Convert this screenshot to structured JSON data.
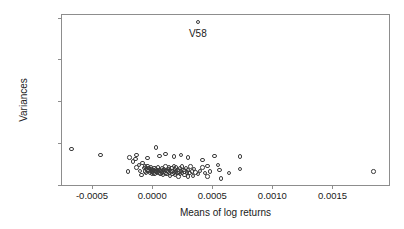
{
  "chart_data": {
    "type": "scatter",
    "title": "",
    "xlabel": "Means of log returns",
    "ylabel": "Variances",
    "xlim": [
      -0.00075,
      0.00197
    ],
    "ylim": [
      0.0,
      0.00203
    ],
    "xticks": [
      -0.0005,
      0.0,
      0.0005,
      0.001,
      0.0015
    ],
    "xtick_labels": [
      "-0.0005",
      "0.0000",
      "0.0005",
      "0.0010",
      "0.0015"
    ],
    "yticks": [
      0.0,
      0.0005,
      0.001,
      0.0015,
      0.002
    ],
    "ytick_labels": [
      "0.0000",
      "0.0005",
      "0.0010",
      "0.0015",
      "0.0020"
    ],
    "grid": false,
    "legend": null,
    "marker": "open-circle",
    "marker_color": "#3c3c3c",
    "annotations": [
      {
        "text": "V58",
        "x": 0.00038,
        "y": 0.00195,
        "describes_point": {
          "x": 0.00038,
          "y": 0.00195
        }
      }
    ],
    "points": [
      {
        "x": -0.00067,
        "y": 0.00043
      },
      {
        "x": -0.00043,
        "y": 0.00036
      },
      {
        "x": 0.00038,
        "y": 0.00195
      },
      {
        "x": -0.0002,
        "y": 0.00016
      },
      {
        "x": -0.00016,
        "y": 0.00028
      },
      {
        "x": -0.00014,
        "y": 0.00031
      },
      {
        "x": -0.00013,
        "y": 0.00021
      },
      {
        "x": -0.00011,
        "y": 0.00024
      },
      {
        "x": -0.0001,
        "y": 0.00017
      },
      {
        "x": -9e-05,
        "y": 0.00012
      },
      {
        "x": -8e-05,
        "y": 0.00026
      },
      {
        "x": -7e-05,
        "y": 0.0002
      },
      {
        "x": -6e-05,
        "y": 0.00016
      },
      {
        "x": -6e-05,
        "y": 0.00022
      },
      {
        "x": -5e-05,
        "y": 0.00019
      },
      {
        "x": -5e-05,
        "y": 0.00014
      },
      {
        "x": -4e-05,
        "y": 0.00018
      },
      {
        "x": -4e-05,
        "y": 0.00023
      },
      {
        "x": -3e-05,
        "y": 0.00017
      },
      {
        "x": -3e-05,
        "y": 0.0002
      },
      {
        "x": -2e-05,
        "y": 0.00015
      },
      {
        "x": -2e-05,
        "y": 0.00019
      },
      {
        "x": -1e-05,
        "y": 0.00017
      },
      {
        "x": -1e-05,
        "y": 0.00021
      },
      {
        "x": 0.0,
        "y": 0.00016
      },
      {
        "x": 0.0,
        "y": 0.00019
      },
      {
        "x": 0.0,
        "y": 0.00013
      },
      {
        "x": 1e-05,
        "y": 0.00018
      },
      {
        "x": 1e-05,
        "y": 0.00015
      },
      {
        "x": 2e-05,
        "y": 0.0002
      },
      {
        "x": 2e-05,
        "y": 0.00017
      },
      {
        "x": 2e-05,
        "y": 0.00013
      },
      {
        "x": 3e-05,
        "y": 0.00016
      },
      {
        "x": 3e-05,
        "y": 0.00019
      },
      {
        "x": 4e-05,
        "y": 0.00014
      },
      {
        "x": 4e-05,
        "y": 0.00018
      },
      {
        "x": 5e-05,
        "y": 0.00016
      },
      {
        "x": 5e-05,
        "y": 0.00021
      },
      {
        "x": 6e-05,
        "y": 0.00015
      },
      {
        "x": 6e-05,
        "y": 0.00018
      },
      {
        "x": 7e-05,
        "y": 0.00013
      },
      {
        "x": 7e-05,
        "y": 0.00017
      },
      {
        "x": 8e-05,
        "y": 0.0002
      },
      {
        "x": 8e-05,
        "y": 0.00015
      },
      {
        "x": 9e-05,
        "y": 0.00018
      },
      {
        "x": 9e-05,
        "y": 0.00012
      },
      {
        "x": 0.0001,
        "y": 0.00016
      },
      {
        "x": 0.0001,
        "y": 0.00019
      },
      {
        "x": 0.00011,
        "y": 0.00014
      },
      {
        "x": 0.00011,
        "y": 0.00022
      },
      {
        "x": 0.00012,
        "y": 0.00017
      },
      {
        "x": 0.00012,
        "y": 0.00013
      },
      {
        "x": 0.00013,
        "y": 0.00019
      },
      {
        "x": 0.00013,
        "y": 0.00016
      },
      {
        "x": 0.00014,
        "y": 0.00021
      },
      {
        "x": 0.00014,
        "y": 0.00014
      },
      {
        "x": 0.00015,
        "y": 0.00018
      },
      {
        "x": 0.00015,
        "y": 0.00011
      },
      {
        "x": 0.00016,
        "y": 0.00016
      },
      {
        "x": 0.00016,
        "y": 0.0002
      },
      {
        "x": 0.00017,
        "y": 0.00013
      },
      {
        "x": 0.00017,
        "y": 0.00017
      },
      {
        "x": 0.00018,
        "y": 0.00023
      },
      {
        "x": 0.00018,
        "y": 0.00015
      },
      {
        "x": 0.00019,
        "y": 0.00019
      },
      {
        "x": 0.00019,
        "y": 0.00012
      },
      {
        "x": 0.0002,
        "y": 0.00016
      },
      {
        "x": 0.0002,
        "y": 0.00021
      },
      {
        "x": 0.00021,
        "y": 0.00014
      },
      {
        "x": 0.00021,
        "y": 0.00018
      },
      {
        "x": 0.00022,
        "y": 0.0001
      },
      {
        "x": 0.00022,
        "y": 0.00016
      },
      {
        "x": 0.00023,
        "y": 0.0002
      },
      {
        "x": 0.00023,
        "y": 0.00013
      },
      {
        "x": 0.00024,
        "y": 0.00017
      },
      {
        "x": 0.00025,
        "y": 0.00014
      },
      {
        "x": 0.00025,
        "y": 0.00022
      },
      {
        "x": 0.00026,
        "y": 0.00018
      },
      {
        "x": 0.00027,
        "y": 0.00012
      },
      {
        "x": 0.00027,
        "y": 0.00016
      },
      {
        "x": 0.00028,
        "y": 0.0002
      },
      {
        "x": 0.00029,
        "y": 0.00015
      },
      {
        "x": 0.0003,
        "y": 0.0001
      },
      {
        "x": 0.0003,
        "y": 0.00018
      },
      {
        "x": 0.00031,
        "y": 0.00014
      },
      {
        "x": 0.00032,
        "y": 0.00022
      },
      {
        "x": 0.00033,
        "y": 0.00016
      },
      {
        "x": 0.00034,
        "y": 0.00011
      },
      {
        "x": 0.00035,
        "y": 0.00019
      },
      {
        "x": 0.00036,
        "y": 0.00015
      },
      {
        "x": 0.00038,
        "y": 0.00013
      },
      {
        "x": 0.0004,
        "y": 0.00017
      },
      {
        "x": 0.00042,
        "y": 0.00021
      },
      {
        "x": 0.00044,
        "y": 0.00014
      },
      {
        "x": 0.00046,
        "y": 0.0001
      },
      {
        "x": 0.00048,
        "y": 0.00016
      },
      {
        "x": -0.00019,
        "y": 0.00033
      },
      {
        "x": -0.00013,
        "y": 0.00036
      },
      {
        "x": -4e-05,
        "y": 0.00032
      },
      {
        "x": 3e-05,
        "y": 0.00045
      },
      {
        "x": 6e-05,
        "y": 0.00035
      },
      {
        "x": 0.00011,
        "y": 0.00037
      },
      {
        "x": 0.00018,
        "y": 0.00034
      },
      {
        "x": 0.00024,
        "y": 0.00036
      },
      {
        "x": 0.0003,
        "y": 0.00033
      },
      {
        "x": 0.00042,
        "y": 0.0003
      },
      {
        "x": 0.00046,
        "y": 0.00023
      },
      {
        "x": 0.00052,
        "y": 0.00035
      },
      {
        "x": 0.00055,
        "y": 0.00024
      },
      {
        "x": 0.00056,
        "y": 0.00018
      },
      {
        "x": 0.00057,
        "y": 8e-05
      },
      {
        "x": 0.00064,
        "y": 0.00014
      },
      {
        "x": 0.00073,
        "y": 0.00034
      },
      {
        "x": 0.00073,
        "y": 0.00019
      },
      {
        "x": 0.00184,
        "y": 0.00016
      }
    ]
  },
  "annotation_labels": {
    "v58": "V58"
  }
}
